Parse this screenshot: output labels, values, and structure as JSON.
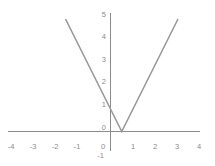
{
  "chart_data": {
    "type": "line",
    "title": "",
    "subtitle": "",
    "xlabel": "",
    "ylabel": "",
    "xlim": [
      -4.5,
      4.0
    ],
    "ylim": [
      -1.4,
      5.4
    ],
    "grid": false,
    "legend": null,
    "series": [
      {
        "name": "y = |2x - 1|",
        "color": "#999999",
        "x": [
          -2,
          0,
          0.5,
          3
        ],
        "values": [
          5,
          1,
          0,
          5
        ],
        "points": [
          {
            "x": -2,
            "y": 5
          },
          {
            "x": 0,
            "y": 1
          },
          {
            "x": 0.5,
            "y": 0
          },
          {
            "x": 3,
            "y": 5
          }
        ]
      }
    ],
    "vertex": {
      "x": 0.5,
      "y": 0
    },
    "x_ticks": [
      {
        "value": -4,
        "label": "-4"
      },
      {
        "value": -3,
        "label": "-3"
      },
      {
        "value": -2,
        "label": "-2"
      },
      {
        "value": -1,
        "label": "-1"
      },
      {
        "value": 0,
        "label": "0"
      },
      {
        "value": 1,
        "label": "1"
      },
      {
        "value": 2,
        "label": "2"
      },
      {
        "value": 3,
        "label": "3"
      },
      {
        "value": 4,
        "label": "4"
      }
    ],
    "y_ticks": [
      {
        "value": 5,
        "label": "5"
      },
      {
        "value": 4,
        "label": "4"
      },
      {
        "value": 3,
        "label": "3"
      },
      {
        "value": 2,
        "label": "2"
      },
      {
        "value": 1,
        "label": "1"
      },
      {
        "value": 0,
        "label": "0"
      },
      {
        "value": -1,
        "label": "-1"
      }
    ],
    "axis_color": "#8c8c8c",
    "label_color": "#8c8c8c",
    "background_color": "#ffffff"
  },
  "axes": {
    "x_axis_name": "x-axis",
    "y_axis_name": "y-axis"
  },
  "ticks": {
    "x": {
      "t0": "-4",
      "t1": "-3",
      "t2": "-2",
      "t3": "-1",
      "t4": "0",
      "t5": "1",
      "t6": "2",
      "t7": "3",
      "t8": "4"
    },
    "y": {
      "t0": "5",
      "t1": "4",
      "t2": "3",
      "t3": "2",
      "t4": "1",
      "t5": "0",
      "t6": "-1"
    }
  }
}
